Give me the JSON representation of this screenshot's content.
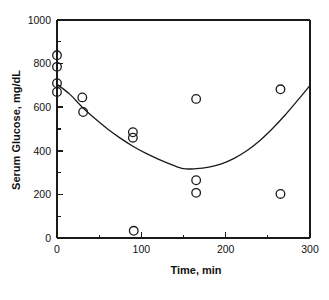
{
  "chart_data": {
    "type": "scatter",
    "title": "",
    "subtitle": "",
    "xlabel": "Time,  min",
    "ylabel": "Serum Glucose, mg/dL",
    "xlim": [
      0,
      300
    ],
    "ylim": [
      0,
      1000
    ],
    "x_ticks_major": [
      0,
      100,
      200,
      300
    ],
    "x_ticks_minor": [
      50,
      150,
      250
    ],
    "y_ticks_major": [
      0,
      200,
      400,
      600,
      800,
      1000
    ],
    "y_ticks_minor": [
      100,
      300,
      500,
      700,
      900
    ],
    "x_tick_labels": [
      "0",
      "100",
      "200",
      "300"
    ],
    "y_tick_labels": [
      "0",
      "200",
      "400",
      "600",
      "800",
      "1000"
    ],
    "grid": false,
    "legend": false,
    "legend_position": "none",
    "marker": "open-circle",
    "marker_size": 6,
    "series": [
      {
        "name": "Serum glucose observations",
        "type": "scatter",
        "points": [
          {
            "x": 0,
            "y": 838
          },
          {
            "x": 0,
            "y": 785
          },
          {
            "x": 0,
            "y": 710
          },
          {
            "x": 0,
            "y": 670
          },
          {
            "x": 30,
            "y": 645
          },
          {
            "x": 31,
            "y": 578
          },
          {
            "x": 90,
            "y": 485
          },
          {
            "x": 90,
            "y": 460
          },
          {
            "x": 91,
            "y": 33
          },
          {
            "x": 165,
            "y": 638
          },
          {
            "x": 165,
            "y": 265
          },
          {
            "x": 165,
            "y": 207
          },
          {
            "x": 265,
            "y": 682
          },
          {
            "x": 265,
            "y": 202
          }
        ]
      },
      {
        "name": "Fitted quadratic curve",
        "type": "line",
        "points": [
          {
            "x": 0,
            "y": 705
          },
          {
            "x": 15,
            "y": 660
          },
          {
            "x": 30,
            "y": 600
          },
          {
            "x": 45,
            "y": 548
          },
          {
            "x": 60,
            "y": 500
          },
          {
            "x": 75,
            "y": 458
          },
          {
            "x": 90,
            "y": 421
          },
          {
            "x": 105,
            "y": 389
          },
          {
            "x": 120,
            "y": 362
          },
          {
            "x": 135,
            "y": 338
          },
          {
            "x": 150,
            "y": 318
          },
          {
            "x": 165,
            "y": 318
          },
          {
            "x": 180,
            "y": 325
          },
          {
            "x": 195,
            "y": 340
          },
          {
            "x": 210,
            "y": 365
          },
          {
            "x": 225,
            "y": 400
          },
          {
            "x": 240,
            "y": 445
          },
          {
            "x": 255,
            "y": 500
          },
          {
            "x": 270,
            "y": 562
          },
          {
            "x": 285,
            "y": 630
          },
          {
            "x": 300,
            "y": 700
          }
        ]
      }
    ],
    "colors": {
      "axis": "#1a1a1a",
      "marker_stroke": "#1a1a1a",
      "curve": "#1a1a1a",
      "background": "#ffffff"
    }
  }
}
